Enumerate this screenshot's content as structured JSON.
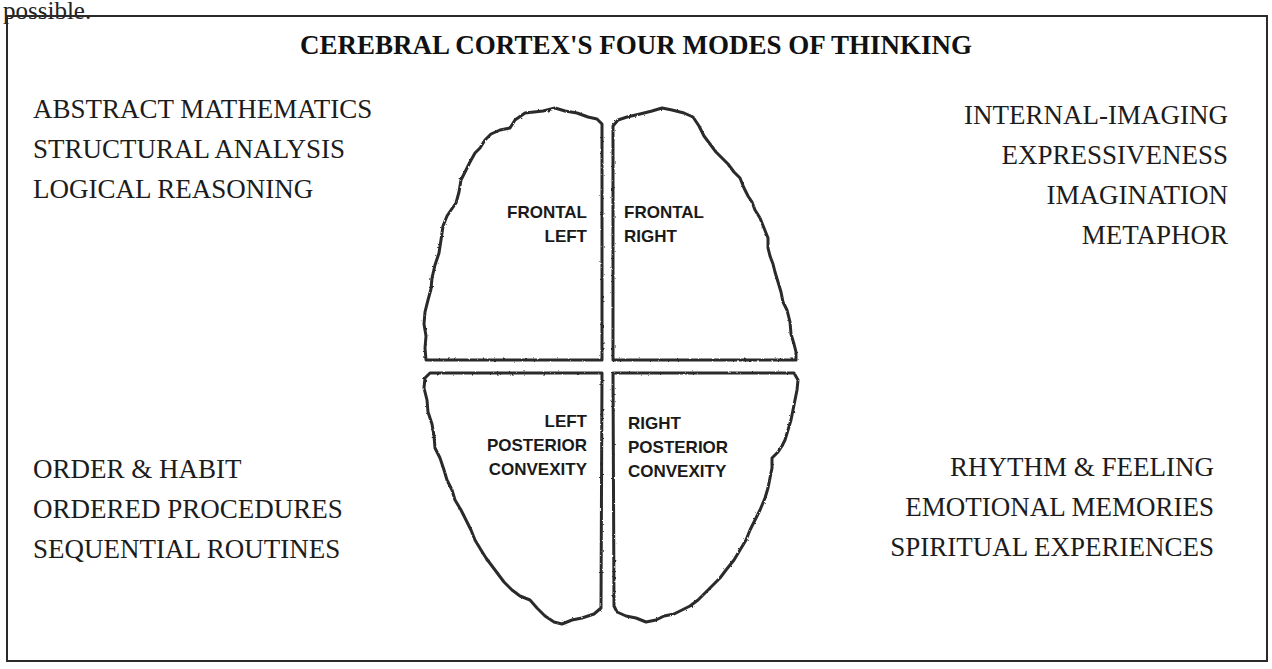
{
  "fragment_text": "possible.",
  "title": "CEREBRAL CORTEX'S FOUR MODES OF THINKING",
  "modes": {
    "top_left": [
      "ABSTRACT MATHEMATICS",
      "STRUCTURAL ANALYSIS",
      "LOGICAL REASONING"
    ],
    "top_right": [
      "INTERNAL-IMAGING",
      "EXPRESSIVENESS",
      "IMAGINATION",
      "METAPHOR"
    ],
    "bottom_left": [
      "ORDER & HABIT",
      "ORDERED PROCEDURES",
      "SEQUENTIAL ROUTINES"
    ],
    "bottom_right": [
      "RHYTHM & FEELING",
      "EMOTIONAL MEMORIES",
      "SPIRITUAL EXPERIENCES"
    ]
  },
  "regions": {
    "frontal_left": [
      "FRONTAL",
      "LEFT"
    ],
    "frontal_right": [
      "FRONTAL",
      "RIGHT"
    ],
    "left_posterior": [
      "LEFT",
      "POSTERIOR",
      "CONVEXITY"
    ],
    "right_posterior": [
      "RIGHT",
      "POSTERIOR",
      "CONVEXITY"
    ]
  },
  "colors": {
    "background": "#ffffff",
    "outline": "#2a2a2a",
    "text": "#1a1a1a"
  }
}
